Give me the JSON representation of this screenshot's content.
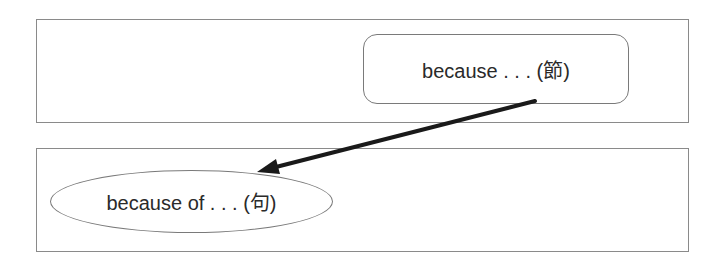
{
  "diagram": {
    "top_panel": {
      "node": {
        "label": "because . . . (節)",
        "shape": "rounded-rectangle"
      }
    },
    "bottom_panel": {
      "node": {
        "label": "because of . . . (句)",
        "shape": "ellipse"
      }
    },
    "arrow": {
      "from": "top_panel.node",
      "to": "bottom_panel.node",
      "color": "#1a1a1a"
    }
  }
}
